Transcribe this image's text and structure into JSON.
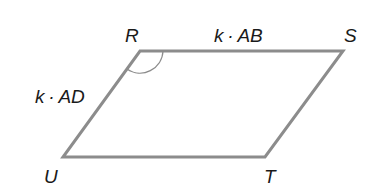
{
  "diagram": {
    "type": "parallelogram",
    "vertices": [
      {
        "name": "R",
        "x": 140,
        "y": 51
      },
      {
        "name": "S",
        "x": 343,
        "y": 51
      },
      {
        "name": "T",
        "x": 265,
        "y": 157
      },
      {
        "name": "U",
        "x": 63,
        "y": 157
      }
    ],
    "labels": {
      "R": "R",
      "S": "S",
      "T": "T",
      "U": "U",
      "top_side": "k · AB",
      "left_side": "k · AD"
    },
    "angle_marker": "R",
    "colors": {
      "edge": "#8c8c8c",
      "text": "#1a1a1a"
    }
  }
}
